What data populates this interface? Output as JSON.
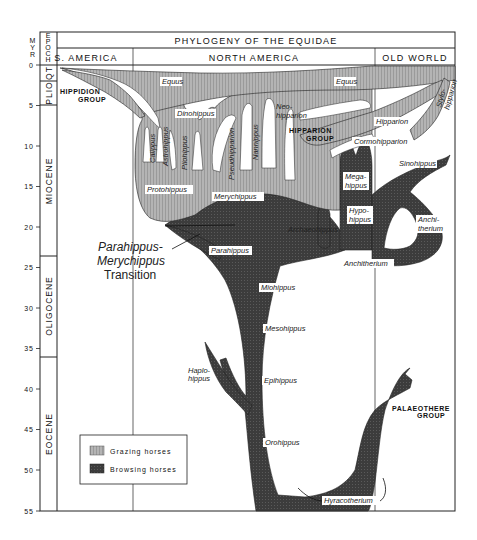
{
  "title": "PHYLOGENY OF THE EQUIDAE",
  "axis": {
    "unit_label": [
      "M",
      "Y",
      "R"
    ],
    "epoch_label": [
      "E",
      "P",
      "O",
      "C",
      "H"
    ],
    "ticks": [
      "0",
      "5",
      "10",
      "15",
      "20",
      "25",
      "30",
      "35",
      "40",
      "45",
      "50",
      "55"
    ]
  },
  "epochs": [
    {
      "name": "QT",
      "from": 0,
      "to": 2
    },
    {
      "name": "PLIO",
      "from": 2,
      "to": 5
    },
    {
      "name": "MIOCENE",
      "from": 5,
      "to": 23.5
    },
    {
      "name": "OLIGOCENE",
      "from": 23.5,
      "to": 36
    },
    {
      "name": "EOCENE",
      "from": 36,
      "to": 55
    }
  ],
  "regions": [
    "S. AMERICA",
    "NORTH AMERICA",
    "OLD WORLD"
  ],
  "groups": {
    "hippidion": [
      "HIPPIDION",
      "GROUP"
    ],
    "hipparion": [
      "HIPPARION",
      "GROUP"
    ],
    "palaeothere": [
      "PALAEOTHERE",
      "GROUP"
    ]
  },
  "taxa": {
    "grazing": [
      "Equus",
      "Equus",
      "Dinohippus",
      "Neo-",
      "hipparion",
      "Calippus",
      "Astrohippus",
      "Pliohippus",
      "Pseudhipparion",
      "Nannippus",
      "Protohippus",
      "Merychippus",
      "Hipparion",
      "Cormohipparion",
      "Stylo-",
      "hipparion"
    ],
    "browsing": [
      "Mega-",
      "hippus",
      "Hypo-",
      "hippus",
      "Sinohippus",
      "Anchi-",
      "therium",
      "Archaeohippus",
      "Anchitherium",
      "Parahippus",
      "Miohippus",
      "Mesohippus",
      "Epihippus",
      "Orohippus",
      "Hyracotherium",
      "Haplo-",
      "hippus"
    ]
  },
  "annotation": {
    "line1": "Parahippus-",
    "line2": "Merychippus",
    "line3": "Transition"
  },
  "legend": {
    "grazing": "Grazing horses",
    "browsing": "Browsing horses"
  },
  "colors": {
    "grazing": "#a9a9a9",
    "browsing": "#3a3a3a",
    "line": "#222222",
    "background": "#ffffff"
  }
}
